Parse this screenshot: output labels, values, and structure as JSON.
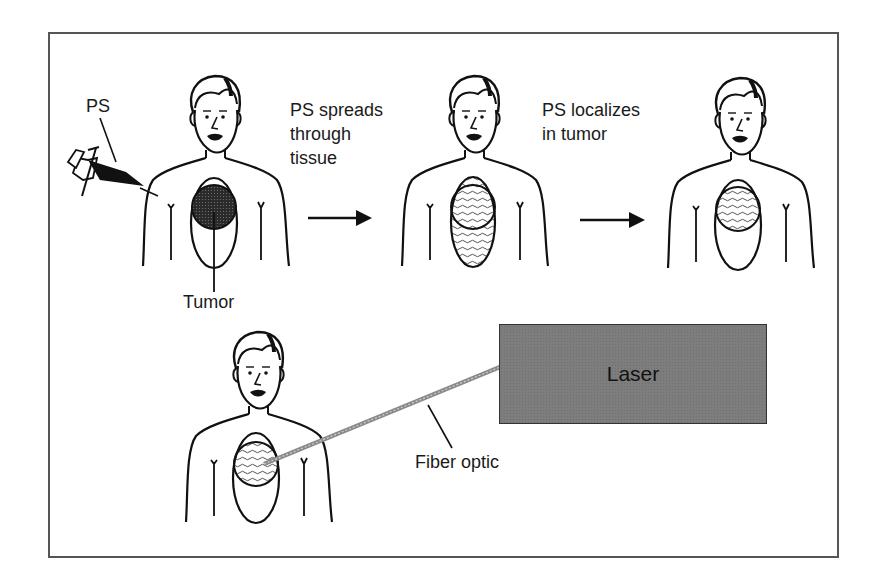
{
  "diagram": {
    "labels": {
      "ps": "PS",
      "step1": "PS spreads\nthrough\ntissue",
      "step2": "PS localizes\nin tumor",
      "tumor": "Tumor",
      "laser": "Laser",
      "fiber": "Fiber optic"
    },
    "figures": [
      {
        "name": "injection",
        "state": "PS injected; tumor dark"
      },
      {
        "name": "spread",
        "state": "PS spread through whole oval region"
      },
      {
        "name": "localized",
        "state": "PS concentrated in tumor circle"
      },
      {
        "name": "treatment",
        "state": "Fiber optic from laser illuminates tumor"
      }
    ],
    "colors": {
      "line": "#111111",
      "laser_fill": "#7d7d7d",
      "frame": "#555555",
      "tumor_dark": "#333333"
    }
  }
}
